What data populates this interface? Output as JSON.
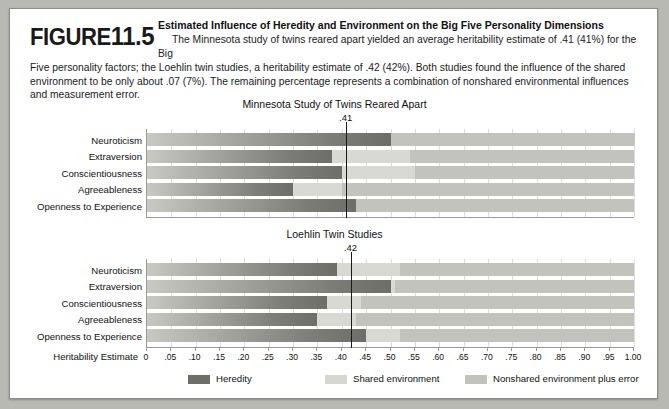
{
  "figure": {
    "label_word": "FIGURE",
    "number": "11.5",
    "title": "Estimated Influence of Heredity and Environment on the Big Five Personality Dimensions",
    "body_lead": "The Minnesota study of twins reared apart yielded an average heritability estimate of .41 (41%) for the Big",
    "body_rest": "Five personality factors; the Loehlin twin studies, a heritability estimate of .42 (42%). Both studies found the influence of the shared environment to be only about .07 (7%). The remaining percentage represents a combination of nonshared environmental influences and measurement error."
  },
  "axis": {
    "label": "Heritability Estimate",
    "ticks": [
      "0",
      ".05",
      ".10",
      ".15",
      ".20",
      ".25",
      ".30",
      ".35",
      ".40",
      ".45",
      ".50",
      ".55",
      ".60",
      ".65",
      ".70",
      ".75",
      ".80",
      ".85",
      ".90",
      ".95",
      "1.00"
    ],
    "min": 0,
    "max": 1.0,
    "step": 0.05
  },
  "legend": {
    "items": [
      {
        "key": "heredity",
        "label": "Heredity",
        "color": "#6e6e69"
      },
      {
        "key": "shared",
        "label": "Shared environment",
        "color": "#d7d7d2"
      },
      {
        "key": "nonshared",
        "label": "Nonshared environment plus error",
        "color": "#c3c3be"
      }
    ]
  },
  "chart_data": [
    {
      "type": "bar",
      "orientation": "horizontal",
      "stacked": true,
      "title": "Minnesota Study of Twins Reared Apart",
      "mean_label": ".41",
      "mean_value": 0.41,
      "xlabel": "Heritability Estimate",
      "ylabel": "",
      "xlim": [
        0,
        1.0
      ],
      "grid": true,
      "legend_position": "bottom",
      "categories": [
        "Neuroticism",
        "Extraversion",
        "Conscientiousness",
        "Agreeableness",
        "Openness to Experience"
      ],
      "series": [
        {
          "name": "Heredity",
          "values": [
            0.5,
            0.38,
            0.4,
            0.3,
            0.43
          ]
        },
        {
          "name": "Shared environment",
          "values": [
            0.0,
            0.16,
            0.15,
            0.1,
            0.0
          ]
        },
        {
          "name": "Nonshared environment plus error",
          "values": [
            0.5,
            0.46,
            0.45,
            0.6,
            0.57
          ]
        }
      ]
    },
    {
      "type": "bar",
      "orientation": "horizontal",
      "stacked": true,
      "title": "Loehlin Twin Studies",
      "mean_label": ".42",
      "mean_value": 0.42,
      "xlabel": "Heritability Estimate",
      "ylabel": "",
      "xlim": [
        0,
        1.0
      ],
      "grid": true,
      "legend_position": "bottom",
      "categories": [
        "Neuroticism",
        "Extraversion",
        "Conscientiousness",
        "Agreeableness",
        "Openness to Experience"
      ],
      "series": [
        {
          "name": "Heredity",
          "values": [
            0.39,
            0.5,
            0.37,
            0.35,
            0.45
          ]
        },
        {
          "name": "Shared environment",
          "values": [
            0.13,
            0.01,
            0.07,
            0.08,
            0.07
          ]
        },
        {
          "name": "Nonshared environment plus error",
          "values": [
            0.48,
            0.49,
            0.56,
            0.57,
            0.48
          ]
        }
      ]
    }
  ]
}
